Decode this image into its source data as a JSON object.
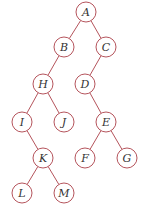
{
  "tree": {
    "nodes": [
      {
        "id": "A",
        "label": "A",
        "x": 86,
        "y": 12
      },
      {
        "id": "B",
        "label": "B",
        "x": 64,
        "y": 47
      },
      {
        "id": "C",
        "label": "C",
        "x": 106,
        "y": 47
      },
      {
        "id": "H",
        "label": "H",
        "x": 43,
        "y": 84
      },
      {
        "id": "D",
        "label": "D",
        "x": 85,
        "y": 84
      },
      {
        "id": "I",
        "label": "I",
        "x": 22,
        "y": 122
      },
      {
        "id": "J",
        "label": "J",
        "x": 64,
        "y": 122
      },
      {
        "id": "E",
        "label": "E",
        "x": 106,
        "y": 122
      },
      {
        "id": "K",
        "label": "K",
        "x": 43,
        "y": 158
      },
      {
        "id": "F",
        "label": "F",
        "x": 85,
        "y": 158
      },
      {
        "id": "G",
        "label": "G",
        "x": 127,
        "y": 158
      },
      {
        "id": "L",
        "label": "L",
        "x": 22,
        "y": 193
      },
      {
        "id": "M",
        "label": "M",
        "x": 64,
        "y": 193
      }
    ],
    "edges": [
      [
        "A",
        "B"
      ],
      [
        "A",
        "C"
      ],
      [
        "B",
        "H"
      ],
      [
        "C",
        "D"
      ],
      [
        "H",
        "I"
      ],
      [
        "H",
        "J"
      ],
      [
        "D",
        "E"
      ],
      [
        "I",
        "K"
      ],
      [
        "E",
        "F"
      ],
      [
        "E",
        "G"
      ],
      [
        "K",
        "L"
      ],
      [
        "K",
        "M"
      ]
    ],
    "radius": 10,
    "stroke_color": "#b5545c"
  }
}
